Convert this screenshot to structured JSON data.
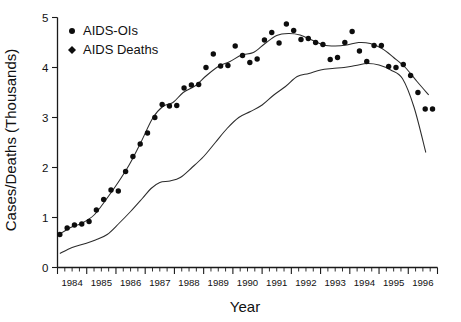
{
  "chart_data": {
    "type": "scatter",
    "title": "",
    "xlabel": "Year",
    "ylabel": "Cases/Deaths (Thousands)",
    "xlim": [
      1984.0,
      1997.0
    ],
    "ylim": [
      0,
      5
    ],
    "yticks": [
      0,
      1,
      2,
      3,
      4,
      5
    ],
    "ytick_labels": [
      "0",
      "1",
      "2",
      "3",
      "4",
      "5"
    ],
    "xticks": [
      1984,
      1985,
      1986,
      1987,
      1988,
      1989,
      1990,
      1991,
      1992,
      1993,
      1994,
      1995,
      1996
    ],
    "xtick_labels": [
      "1984",
      "1985",
      "1986",
      "1987",
      "1988",
      "1989",
      "1990",
      "1991",
      "1992",
      "1993",
      "1994",
      "1995",
      "1996"
    ],
    "x_minor_interval": 0.25,
    "grid": false,
    "legend_position": "top-left",
    "marker_color": "#0d0d0d",
    "trendline_color": "#2b2b2b",
    "series": [
      {
        "name": "AIDS-OIs",
        "marker": "circle",
        "x": [
          1984.08,
          1984.33,
          1984.58,
          1984.83,
          1985.08,
          1985.33,
          1985.58,
          1985.83,
          1986.08,
          1986.33,
          1986.58,
          1986.83,
          1987.08,
          1987.33,
          1987.58,
          1987.83,
          1988.08,
          1988.33,
          1988.58,
          1988.83,
          1989.08,
          1989.33,
          1989.58,
          1989.83,
          1990.08,
          1990.33,
          1990.58,
          1990.83,
          1991.08,
          1991.33,
          1991.58,
          1991.83,
          1992.08,
          1992.33,
          1992.58,
          1992.83,
          1993.08,
          1993.33,
          1993.58,
          1993.83,
          1994.08,
          1994.33,
          1994.58,
          1994.83,
          1995.08,
          1995.33,
          1995.58,
          1995.83,
          1996.08,
          1996.33,
          1996.58,
          1996.83
        ],
        "y": [
          0.66,
          0.79,
          0.85,
          0.87,
          0.92,
          1.15,
          1.36,
          1.55,
          1.53,
          1.92,
          2.22,
          2.47,
          2.69,
          3.0,
          3.26,
          3.23,
          3.24,
          3.59,
          3.65,
          3.66,
          4.0,
          4.27,
          4.03,
          4.04,
          4.43,
          4.24,
          4.1,
          4.17,
          4.55,
          4.7,
          4.49,
          4.87,
          4.74,
          4.56,
          4.58,
          4.5,
          4.46,
          4.16,
          4.2,
          4.5,
          4.72,
          4.33,
          4.12,
          4.44,
          4.44,
          4.02,
          4.0,
          4.06,
          3.84,
          3.5,
          3.17,
          3.17
        ]
      },
      {
        "name": "AIDS Deaths",
        "marker": "diamond",
        "x": [
          1984.08,
          1984.33,
          1984.58,
          1984.83,
          1985.08,
          1985.33,
          1985.58,
          1985.83,
          1986.08,
          1986.33,
          1986.58,
          1986.83,
          1987.08,
          1987.33,
          1987.58,
          1987.83,
          1988.08,
          1988.33,
          1988.58,
          1988.83,
          1989.08,
          1989.33,
          1989.58,
          1989.83,
          1990.08,
          1990.33,
          1990.58,
          1990.83,
          1991.08,
          1991.33,
          1991.58,
          1991.83,
          1992.08,
          1992.33,
          1992.58,
          1992.83,
          1993.08,
          1993.33,
          1993.58,
          1993.83,
          1994.08,
          1994.33,
          1994.58,
          1994.83,
          1995.08,
          1995.33,
          1995.58,
          1995.83,
          1996.08,
          1996.33,
          1996.58,
          1996.83
        ],
        "y": [
          0.27,
          0.35,
          0.41,
          0.45,
          0.5,
          0.55,
          0.63,
          0.71,
          0.85,
          1.05,
          1.2,
          1.33,
          1.5,
          1.62,
          1.71,
          1.72,
          1.72,
          1.73,
          1.9,
          2.13,
          2.2,
          2.33,
          2.71,
          2.7,
          3.05,
          3.15,
          3.2,
          3.1,
          3.24,
          3.45,
          3.5,
          3.58,
          3.96,
          3.84,
          3.73,
          3.86,
          4.04,
          3.85,
          4.0,
          4.0,
          4.0,
          4.04,
          4.06,
          4.16,
          4.05,
          3.9,
          3.83,
          3.9,
          3.35,
          2.74,
          2.25,
          1.79
        ]
      }
    ],
    "trend_lines": [
      {
        "name": "AIDS-OIs-trend",
        "x": [
          1984.08,
          1984.45,
          1984.85,
          1985.25,
          1985.65,
          1986.05,
          1986.45,
          1986.85,
          1987.25,
          1987.6,
          1987.95,
          1988.3,
          1988.7,
          1989.1,
          1989.5,
          1989.9,
          1990.3,
          1990.7,
          1991.1,
          1991.5,
          1991.9,
          1992.3,
          1992.7,
          1993.1,
          1993.5,
          1993.9,
          1994.3,
          1994.7,
          1995.1,
          1995.5,
          1995.9,
          1996.3,
          1996.7
        ],
        "y": [
          0.67,
          0.8,
          0.89,
          1.05,
          1.35,
          1.68,
          2.05,
          2.5,
          2.98,
          3.22,
          3.3,
          3.5,
          3.63,
          3.84,
          4.02,
          4.12,
          4.25,
          4.3,
          4.48,
          4.64,
          4.68,
          4.65,
          4.55,
          4.45,
          4.43,
          4.45,
          4.5,
          4.48,
          4.38,
          4.2,
          4.0,
          3.72,
          3.45
        ]
      },
      {
        "name": "AIDS-Deaths-trend",
        "x": [
          1984.08,
          1984.5,
          1984.9,
          1985.3,
          1985.7,
          1986.1,
          1986.5,
          1986.9,
          1987.2,
          1987.5,
          1987.85,
          1988.2,
          1988.6,
          1989.0,
          1989.4,
          1989.8,
          1990.2,
          1990.6,
          1991.0,
          1991.4,
          1991.8,
          1992.2,
          1992.6,
          1993.0,
          1993.4,
          1993.8,
          1994.2,
          1994.6,
          1995.0,
          1995.4,
          1995.8,
          1996.2,
          1996.6
        ],
        "y": [
          0.28,
          0.4,
          0.47,
          0.55,
          0.66,
          0.88,
          1.12,
          1.38,
          1.58,
          1.7,
          1.73,
          1.8,
          2.0,
          2.22,
          2.5,
          2.78,
          3.0,
          3.12,
          3.25,
          3.45,
          3.62,
          3.82,
          3.88,
          3.95,
          3.98,
          4.0,
          4.04,
          4.08,
          4.05,
          3.95,
          3.78,
          3.2,
          2.3
        ]
      }
    ]
  },
  "legend": {
    "items": [
      {
        "label": "AIDS-OIs",
        "marker": "circle"
      },
      {
        "label": "AIDS Deaths",
        "marker": "diamond"
      }
    ]
  }
}
